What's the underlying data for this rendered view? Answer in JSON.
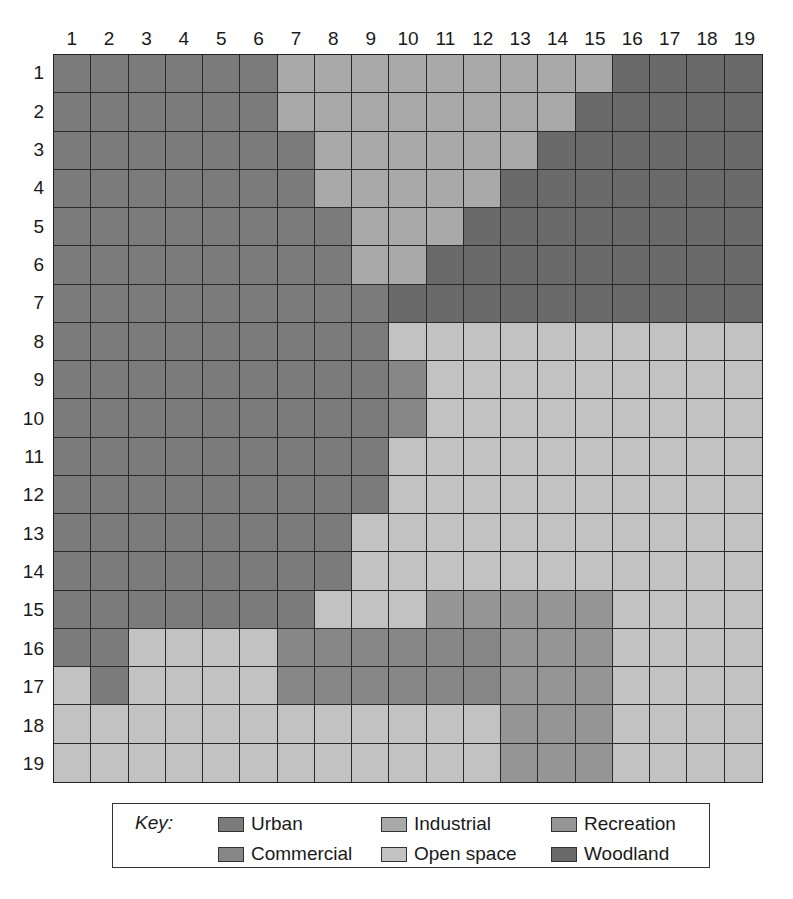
{
  "map": {
    "columns": [
      "1",
      "2",
      "3",
      "4",
      "5",
      "6",
      "7",
      "8",
      "9",
      "10",
      "11",
      "12",
      "13",
      "14",
      "15",
      "16",
      "17",
      "18",
      "19"
    ],
    "rows": [
      "1",
      "2",
      "3",
      "4",
      "5",
      "6",
      "7",
      "8",
      "9",
      "10",
      "11",
      "12",
      "13",
      "14",
      "15",
      "16",
      "17",
      "18",
      "19"
    ],
    "land_use_codes": {
      "U": "Urban",
      "C": "Commercial",
      "I": "Industrial",
      "O": "Open space",
      "R": "Recreation",
      "W": "Woodland"
    },
    "grid": [
      "UUUUUUIIIIIIIIIWWWW",
      "UUUUUUIIIIIIIIWWWWW",
      "UUUUUUUIIIIIIWWWWWW",
      "UUUUUUUIIIIIWWWWWWW",
      "UUUUUUUUIIIWWWWWWWW",
      "UUUUUUUUIIWWWWWWWWW",
      "UUUUUUUUUWWWWWWWWWW",
      "UUUUUUUUUOOOOOOOOOO",
      "UUUUUUUUUCOOOOOOOOO",
      "UUUUUUUUUCOOOOOOOOO",
      "UUUUUUUUUOOOOOOOOOO",
      "UUUUUUUUUOOOOOOOOOO",
      "UUUUUUUUOOOOOOOOOOO",
      "UUUUUUUUOOOOOOOOOOO",
      "UUUUUUUOOORRRRROOOO",
      "UUOOOOCCCCCCRRROOOO",
      "OUOOOOCCCCCCRRROOOO",
      "OOOOOOOOOOOORRROOOO",
      "OOOOOOOOOOOORRROOOO"
    ]
  },
  "colors": {
    "U": "#7b7b7b",
    "C": "#878787",
    "I": "#a9a9a9",
    "O": "#c2c2c2",
    "R": "#959595",
    "W": "#6a6a6a"
  },
  "legend": {
    "key_label": "Key:",
    "items": [
      {
        "code": "U",
        "label": "Urban"
      },
      {
        "code": "I",
        "label": "Industrial"
      },
      {
        "code": "R",
        "label": "Recreation"
      },
      {
        "code": "C",
        "label": "Commercial"
      },
      {
        "code": "O",
        "label": "Open space"
      },
      {
        "code": "W",
        "label": "Woodland"
      }
    ]
  }
}
